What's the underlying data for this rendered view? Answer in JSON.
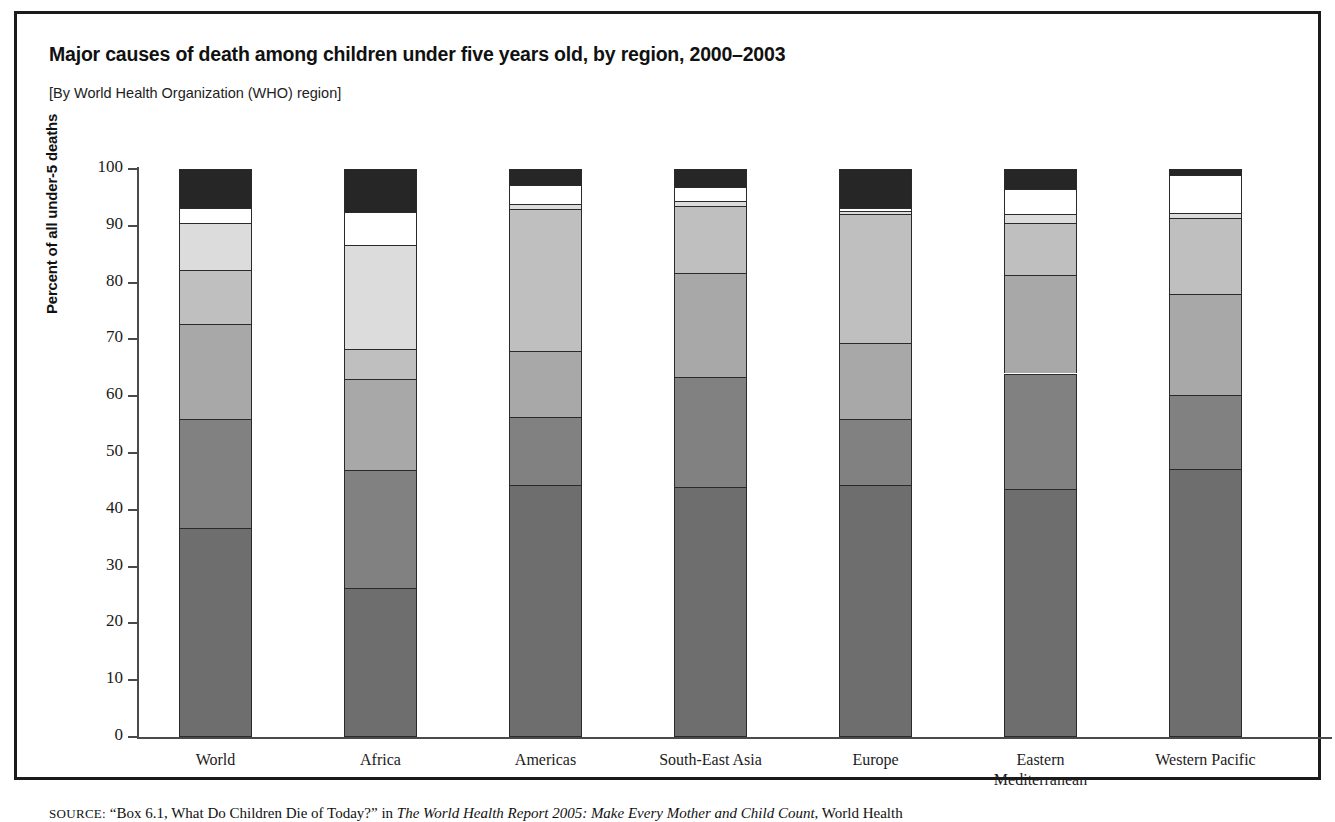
{
  "figure": {
    "title": "Major causes of death among children under five years old, by region, 2000–2003",
    "subtitle": "[By World Health Organization (WHO) region]",
    "source_prefix": "SOURCE:",
    "source_text_1": " “Box 6.1, What Do Children Die of Today?” in ",
    "source_italic_1": "The World Health Report 2005: Make Every Mother and Child Count",
    "source_text_2": ", World Health"
  },
  "chart_data": {
    "type": "bar",
    "subtype": "stacked-percent",
    "title": "Major causes of death among children under five years old, by region, 2000–2003",
    "subtitle": "[By World Health Organization (WHO) region]",
    "xlabel": "",
    "ylabel": "Percent of all under-5 deaths",
    "ylim": [
      0,
      100
    ],
    "yticks": [
      0,
      10,
      20,
      30,
      40,
      50,
      60,
      70,
      80,
      90,
      100
    ],
    "ytick_labels": [
      "0",
      "10",
      "20",
      "30",
      "40",
      "50",
      "60",
      "70",
      "80",
      "90",
      "100"
    ],
    "grid": false,
    "legend": "none",
    "categories": [
      "World",
      "Africa",
      "Americas",
      "South-East Asia",
      "Europe",
      "Eastern Mediterranean",
      "Western Pacific"
    ],
    "category_lines": [
      [
        "World"
      ],
      [
        "Africa"
      ],
      [
        "Americas"
      ],
      [
        "South-East Asia"
      ],
      [
        "Europe"
      ],
      [
        "Eastern",
        "Mediterranean"
      ],
      [
        "Western Pacific"
      ]
    ],
    "series": [
      {
        "name": "segment-1",
        "color": "#6e6e6e",
        "order": 1,
        "values": [
          36.8,
          26.2,
          44.3,
          44.1,
          44.3,
          43.7,
          47.2
        ]
      },
      {
        "name": "segment-2",
        "color": "#818181",
        "order": 2,
        "values": [
          19.2,
          20.8,
          12.1,
          19.2,
          11.7,
          20.3,
          13.1
        ]
      },
      {
        "name": "segment-3",
        "color": "#a8a8a8",
        "order": 3,
        "values": [
          16.8,
          16.1,
          11.6,
          18.4,
          13.3,
          17.3,
          17.7
        ]
      },
      {
        "name": "segment-4",
        "color": "#bfbfbf",
        "order": 4,
        "values": [
          9.5,
          5.2,
          24.9,
          11.8,
          22.7,
          9.2,
          13.3
        ]
      },
      {
        "name": "segment-5",
        "color": "#dcdcdc",
        "order": 5,
        "values": [
          8.2,
          18.4,
          0.9,
          0.9,
          0.6,
          1.5,
          1.0
        ]
      },
      {
        "name": "segment-6",
        "color": "#ffffff",
        "order": 6,
        "values": [
          2.7,
          5.8,
          3.4,
          2.4,
          0.5,
          4.5,
          6.7
        ]
      },
      {
        "name": "segment-7",
        "color": "#262626",
        "order": 7,
        "values": [
          6.8,
          7.5,
          2.8,
          3.2,
          6.9,
          3.5,
          1.0
        ]
      }
    ],
    "cumulative_tops": {
      "World": [
        36.8,
        56.0,
        72.8,
        82.3,
        90.5,
        93.2,
        100.0
      ],
      "Africa": [
        26.2,
        47.0,
        63.1,
        68.3,
        86.7,
        92.5,
        100.0
      ],
      "Americas": [
        44.3,
        56.4,
        68.0,
        92.9,
        93.8,
        97.2,
        100.0
      ],
      "South-East Asia": [
        44.1,
        63.3,
        81.7,
        93.5,
        94.4,
        96.8,
        100.0
      ],
      "Europe": [
        44.3,
        56.0,
        69.3,
        92.0,
        92.6,
        93.1,
        100.0
      ],
      "Eastern Mediterranean": [
        43.7,
        64.0,
        81.3,
        90.5,
        92.0,
        96.5,
        100.0
      ],
      "Western Pacific": [
        47.2,
        60.3,
        78.0,
        91.3,
        92.3,
        99.0,
        100.0
      ]
    }
  }
}
